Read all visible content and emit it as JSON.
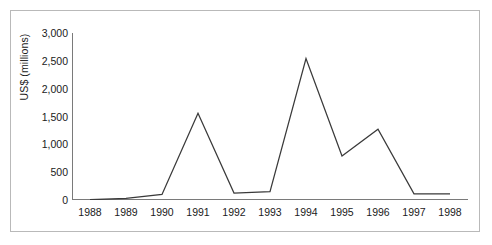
{
  "chart_data": {
    "type": "line",
    "title": "",
    "xlabel": "",
    "ylabel": "US$ (millions)",
    "categories": [
      "1988",
      "1989",
      "1990",
      "1991",
      "1992",
      "1993",
      "1994",
      "1995",
      "1996",
      "1997",
      "1998"
    ],
    "values": [
      5,
      30,
      100,
      1560,
      125,
      150,
      2540,
      790,
      1270,
      110,
      110
    ],
    "series": [
      {
        "name": "US$ (millions)",
        "values": [
          5,
          30,
          100,
          1560,
          125,
          150,
          2540,
          790,
          1270,
          110,
          110
        ]
      }
    ],
    "ylim": [
      0,
      3000
    ],
    "ytick_values": [
      0,
      500,
      1000,
      1500,
      2000,
      2500,
      3000
    ],
    "ytick_labels": [
      "0",
      "500",
      "1,000",
      "1,500",
      "2,000",
      "2,500",
      "3,000"
    ],
    "grid": false,
    "legend": false,
    "legend_position": "none",
    "line_color": "#3a3a3a",
    "axis_color": "#7a7a7a",
    "frame_color": "#b9b9b9",
    "text_color": "#1a1a1a"
  }
}
